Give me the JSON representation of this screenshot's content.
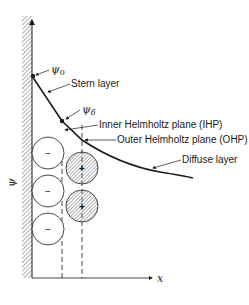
{
  "diagram": {
    "type": "electrical-double-layer",
    "axes": {
      "y_label": "ψ",
      "x_label": "x"
    },
    "potentials": {
      "psi0": "ψ0",
      "psi_delta": "ψδ"
    },
    "labels": {
      "stern_layer": "Stern layer",
      "ihp": "Inner Helmholtz plane (IHP)",
      "ohp": "Outer Helmholtz plane (OHP)",
      "diffuse_layer": "Diffuse layer"
    },
    "ions": {
      "negative": [
        "−",
        "−",
        "−"
      ],
      "positive": [
        "+",
        "+"
      ]
    },
    "colors": {
      "line": "#1a1a1a",
      "hatch": "#8a8a8a",
      "background": "#ffffff"
    }
  }
}
